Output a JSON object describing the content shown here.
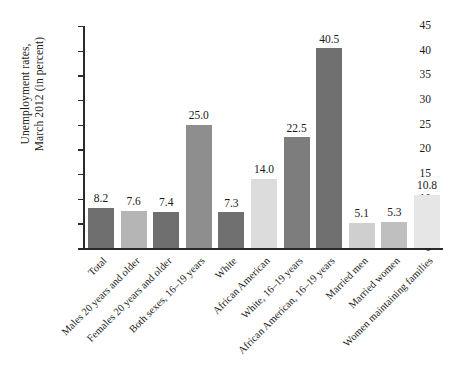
{
  "chart_data": {
    "type": "bar",
    "title": "",
    "xlabel": "",
    "ylabel": "Unemployment rates, March 2012 (in percent)",
    "ylabel_lines": [
      "Unemployment rates,",
      "March 2012 (in percent)"
    ],
    "ylim": [
      0,
      45
    ],
    "yticks": [
      0,
      5,
      10,
      15,
      20,
      25,
      30,
      35,
      40,
      45
    ],
    "ytick_labels": [
      "0",
      "5",
      "10",
      "15",
      "20",
      "25",
      "30",
      "35",
      "40",
      "45"
    ],
    "grid": false,
    "legend": "none",
    "categories": [
      "Total",
      "Males 20 years and older",
      "Females 20 years and older",
      "Both sexes, 16–19 years",
      "White",
      "African American",
      "White, 16–19 years",
      "African American, 16–19 years",
      "Married men",
      "Married women",
      "Women maintaining families"
    ],
    "values": [
      8.2,
      7.6,
      7.4,
      25.0,
      7.3,
      14.0,
      22.5,
      40.5,
      5.1,
      5.3,
      10.8
    ],
    "value_labels": [
      "8.2",
      "7.6",
      "7.4",
      "25.0",
      "7.3",
      "14.0",
      "22.5",
      "40.5",
      "5.1",
      "5.3",
      "10.8"
    ],
    "bar_colors": [
      "#6f6f6f",
      "#b5b5b5",
      "#6f6f6f",
      "#8e8e8e",
      "#707070",
      "#dcdcdc",
      "#7d7d7d",
      "#707070",
      "#cfcfcf",
      "#bfbfbf",
      "#e6e6e6"
    ],
    "axis_color": "#2b2b2b"
  }
}
